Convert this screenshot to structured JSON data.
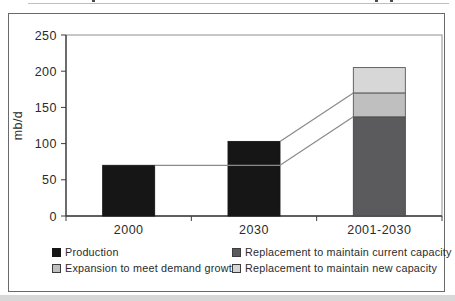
{
  "page": {
    "top_edge_note": "cropped illegible text fragments along top edge",
    "background_color": "#ffffff",
    "bottom_strip_color": "#d8d8d8",
    "frame_border_color": "#6a6a6a"
  },
  "chart_data": {
    "type": "bar",
    "stacked": true,
    "title": "",
    "xlabel": "",
    "ylabel": "mb/d",
    "ylim": [
      0,
      250
    ],
    "yticks": [
      0,
      50,
      100,
      150,
      200,
      250
    ],
    "grid": false,
    "legend_position": "bottom",
    "categories": [
      "2000",
      "2030",
      "2001-2030"
    ],
    "bars": [
      {
        "category": "2000",
        "total": 70,
        "segments": [
          {
            "name": "Production",
            "value": 70,
            "color": "#161616",
            "border": "#161616"
          }
        ]
      },
      {
        "category": "2030",
        "total": 103,
        "segments": [
          {
            "name": "Production",
            "value": 103,
            "color": "#161616",
            "border": "#161616"
          }
        ]
      },
      {
        "category": "2001-2030",
        "total": 205,
        "segments": [
          {
            "name": "Replacement to maintain current capacity",
            "value": 137,
            "color": "#5b5b5d",
            "border": "#454547"
          },
          {
            "name": "Expansion to meet demand growth",
            "value": 33,
            "color": "#bfbfbf",
            "border": "#565656"
          },
          {
            "name": "Replacement to maintain new capacity",
            "value": 35,
            "color": "#d7d7d7",
            "border": "#565656"
          }
        ]
      }
    ],
    "connector_lines": [
      {
        "from_bar": 0,
        "from_value": 70,
        "to_bar": 1,
        "to_value": 70,
        "to_side": "right"
      },
      {
        "from_bar": 1,
        "from_value": 103,
        "to_bar": 2,
        "to_value": 170,
        "to_side": "left"
      },
      {
        "from_bar": 1,
        "from_value": 70,
        "to_bar": 2,
        "to_value": 137,
        "to_side": "left"
      }
    ]
  },
  "legend": {
    "items": [
      {
        "label": "Production",
        "color": "#161616",
        "border": "#161616"
      },
      {
        "label": "Replacement to maintain current capacity",
        "color": "#5b5b5d",
        "border": "#3d3d3d"
      },
      {
        "label": "Expansion to meet demand growth",
        "color": "#bfbfbf",
        "border": "#3d3d3d"
      },
      {
        "label": "Replacement to maintain new capacity",
        "color": "#d7d7d7",
        "border": "#3d3d3d"
      }
    ]
  }
}
